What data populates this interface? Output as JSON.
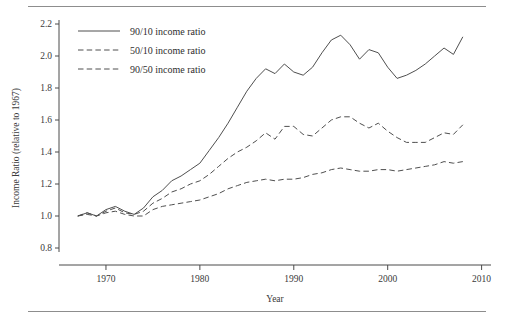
{
  "figure": {
    "rules": {
      "top": "horizontal-rule",
      "bottom": "horizontal-rule"
    }
  },
  "chart_data": {
    "type": "line",
    "title": "",
    "xlabel": "Year",
    "ylabel": "Income Ratio (relative to 1967)",
    "xlim": [
      1965,
      2011
    ],
    "ylim": [
      0.8,
      2.2
    ],
    "xticks": [
      1970,
      1980,
      1990,
      2000,
      2010
    ],
    "yticks": [
      0.8,
      1.0,
      1.2,
      1.4,
      1.6,
      1.8,
      2.0,
      2.2
    ],
    "grid": false,
    "legend_position": "top-left",
    "x": [
      1967,
      1968,
      1969,
      1970,
      1971,
      1972,
      1973,
      1974,
      1975,
      1976,
      1977,
      1978,
      1979,
      1980,
      1981,
      1982,
      1983,
      1984,
      1985,
      1986,
      1987,
      1988,
      1989,
      1990,
      1991,
      1992,
      1993,
      1994,
      1995,
      1996,
      1997,
      1998,
      1999,
      2000,
      2001,
      2002,
      2003,
      2004,
      2005,
      2006,
      2007,
      2008
    ],
    "series": [
      {
        "name": "90/10 income ratio",
        "style": "solid",
        "values": [
          1.0,
          1.02,
          1.0,
          1.04,
          1.06,
          1.03,
          1.01,
          1.05,
          1.12,
          1.16,
          1.22,
          1.25,
          1.29,
          1.33,
          1.41,
          1.49,
          1.58,
          1.68,
          1.78,
          1.86,
          1.92,
          1.89,
          1.95,
          1.9,
          1.88,
          1.93,
          2.02,
          2.1,
          2.13,
          2.07,
          1.98,
          2.04,
          2.02,
          1.93,
          1.86,
          1.88,
          1.91,
          1.95,
          2.0,
          2.05,
          2.01,
          2.12
        ]
      },
      {
        "name": "50/10 income ratio",
        "style": "dashed",
        "values": [
          1.0,
          1.02,
          1.0,
          1.03,
          1.05,
          1.02,
          1.01,
          1.03,
          1.08,
          1.11,
          1.15,
          1.17,
          1.2,
          1.22,
          1.26,
          1.31,
          1.36,
          1.4,
          1.43,
          1.47,
          1.52,
          1.48,
          1.56,
          1.56,
          1.51,
          1.5,
          1.55,
          1.6,
          1.62,
          1.62,
          1.58,
          1.55,
          1.58,
          1.53,
          1.49,
          1.46,
          1.46,
          1.46,
          1.49,
          1.52,
          1.51,
          1.57
        ]
      },
      {
        "name": "90/50 income ratio",
        "style": "dashed",
        "values": [
          1.0,
          1.01,
          1.0,
          1.02,
          1.03,
          1.01,
          1.0,
          1.0,
          1.04,
          1.06,
          1.07,
          1.08,
          1.09,
          1.1,
          1.12,
          1.14,
          1.17,
          1.19,
          1.21,
          1.22,
          1.23,
          1.22,
          1.23,
          1.23,
          1.24,
          1.26,
          1.27,
          1.29,
          1.3,
          1.29,
          1.28,
          1.28,
          1.29,
          1.29,
          1.28,
          1.29,
          1.3,
          1.31,
          1.32,
          1.34,
          1.33,
          1.34
        ]
      }
    ]
  }
}
